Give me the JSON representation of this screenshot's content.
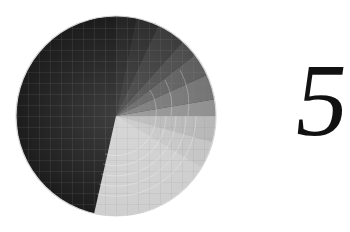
{
  "countdown": {
    "number": "5",
    "dial": {
      "center": [
        116,
        116
      ],
      "radius": 100,
      "dark_color": "#1c1c1c",
      "light_color": "#dcdcdc",
      "grid_spacing": 11,
      "sweep_edge_angle_deg": 193
    }
  }
}
